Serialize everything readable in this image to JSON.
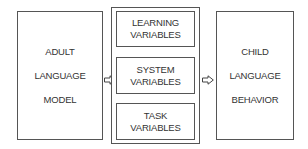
{
  "diagram": {
    "left_box": {
      "lines": [
        "ADULT",
        "LANGUAGE",
        "MODEL"
      ]
    },
    "middle_group": {
      "boxes": [
        {
          "lines": [
            "LEARNING",
            "VARIABLES"
          ]
        },
        {
          "lines": [
            "SYSTEM",
            "VARIABLES"
          ]
        },
        {
          "lines": [
            "TASK",
            "VARIABLES"
          ]
        }
      ]
    },
    "right_box": {
      "lines": [
        "CHILD",
        "LANGUAGE",
        "BEHAVIOR"
      ]
    },
    "arrows": [
      "hollow-right-arrow",
      "hollow-right-arrow"
    ],
    "colors": {
      "stroke": "#555555",
      "text": "#333333",
      "background": "#ffffff"
    }
  }
}
